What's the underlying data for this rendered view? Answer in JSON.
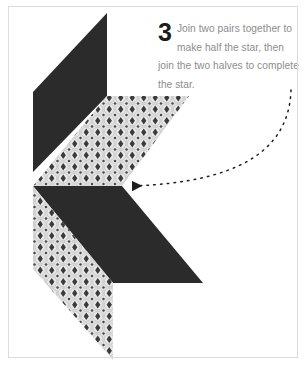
{
  "page": {
    "background_color": "#ffffff",
    "frame_color": "#dcdcdc"
  },
  "caption": {
    "step_number": "3",
    "text": "Join two pairs together to make half the star, then join the two halves to complete the star.",
    "text_color": "#8d8d8d",
    "number_color": "#1d1d1d"
  },
  "illustration": {
    "title": "quilted star assembly diagram",
    "colors": {
      "dark_fabric": "#2b2b2b",
      "pattern_background": "#e8e8e8",
      "pattern_motif": "#3a3a3a",
      "pattern_ring": "#c3c3c3",
      "arrow": "#1d1d1d"
    },
    "shapes": [
      {
        "name": "upper-dark-diamond",
        "fill": "dark",
        "points": "107,13 107,96 33,172 33,92"
      },
      {
        "name": "upper-patterned-diamond",
        "fill": "pattern",
        "points": "107,96 189,96 122,186 33,186"
      },
      {
        "name": "lower-dark-diamond",
        "fill": "dark",
        "points": "33,186 122,186 203,283 113,283"
      },
      {
        "name": "lower-patterned-diamond",
        "fill": "pattern",
        "points": "33,186 113,283 113,360 33,269"
      }
    ],
    "arrow": {
      "name": "curved-dotted-arrow",
      "path": "M291,90 C288,150 240,183 131,186",
      "head_tip": [
        122,
        186
      ],
      "dash": "1.6 5.2"
    }
  }
}
